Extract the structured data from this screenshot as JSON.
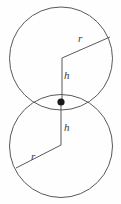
{
  "figure": {
    "name": "two-tangent-circles-radius-height-diagram",
    "background_color": "#fefefe",
    "stroke_color": "#595959",
    "dot_color": "#1a1a1a",
    "stroke_width": 1,
    "labels": {
      "r_top": "r",
      "h_top": "h",
      "h_bottom": "h",
      "r_bottom": "r"
    },
    "circles": [
      {
        "name": "upper-circle",
        "cx": 61,
        "cy": 58.5,
        "r": 51.5
      },
      {
        "name": "lower-circle",
        "cx": 61,
        "cy": 146.0,
        "r": 51.5
      }
    ],
    "center_dot": {
      "cx": 61,
      "cy": 102,
      "r": 3.6
    },
    "polyline_upper": "110,37 62,58 62,102",
    "polyline_lower": "61,102 61,145 16,168"
  }
}
